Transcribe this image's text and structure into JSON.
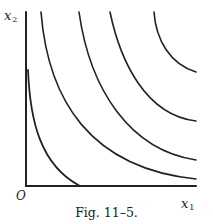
{
  "figure": {
    "caption": "Fig. 11–5.",
    "axes": {
      "x_label": "x",
      "x_subscript": "1",
      "y_label": "x",
      "y_subscript": "2",
      "origin_label": "O"
    },
    "curve_count": 4
  },
  "colors": {
    "ink": "#222222",
    "background": "#ffffff"
  }
}
